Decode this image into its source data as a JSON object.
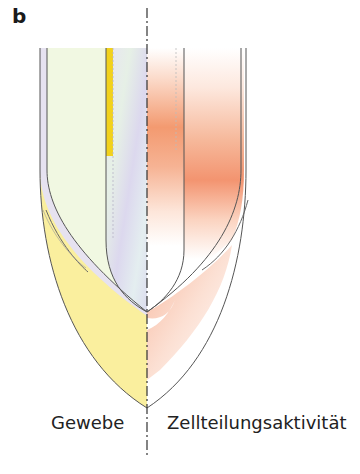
{
  "figure": {
    "panel_label": "b",
    "captions": {
      "left": "Gewebe",
      "right": "Zellteilungsaktivität"
    },
    "colors": {
      "tissue_green": "#f0f8e0",
      "tissue_yellow": "#faee9a",
      "yellow_band": "#f0d020",
      "lilac_band": "#e2dff0",
      "activity_orange": "#f08a5d",
      "outline": "#555555"
    }
  }
}
